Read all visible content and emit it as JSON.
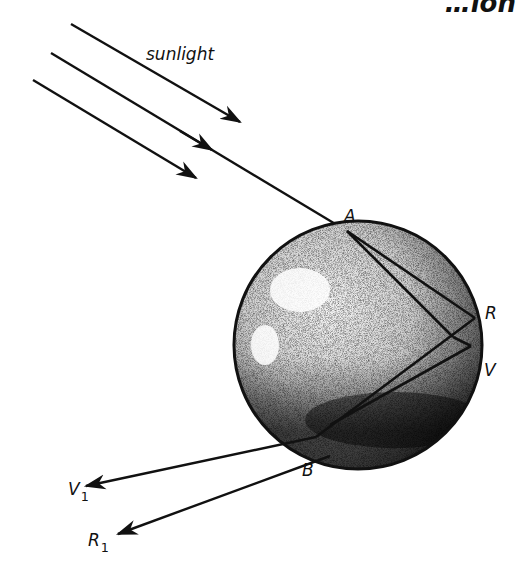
{
  "diagram": {
    "clipped_header_fragment": "…ion",
    "labels": {
      "sunlight": "sunlight",
      "A": "A",
      "R": "R",
      "V": "V",
      "B": "B",
      "V1_main": "V",
      "V1_sub": "1",
      "R1_main": "R",
      "R1_sub": "1"
    },
    "colors": {
      "ink": "#111111",
      "background": "#ffffff",
      "shade_dark": "#1a1a1a",
      "shade_light": "#d8d8d8"
    },
    "geometry": {
      "drop_center": [
        358,
        345
      ],
      "drop_radius": 124,
      "point_A": [
        347,
        231
      ],
      "point_R": [
        475,
        318
      ],
      "point_V": [
        471,
        346
      ],
      "point_B": [
        316,
        437
      ],
      "internal_apex": [
        453,
        337
      ],
      "exit_V1": [
        85,
        486
      ],
      "exit_R1": [
        117,
        534
      ]
    }
  }
}
